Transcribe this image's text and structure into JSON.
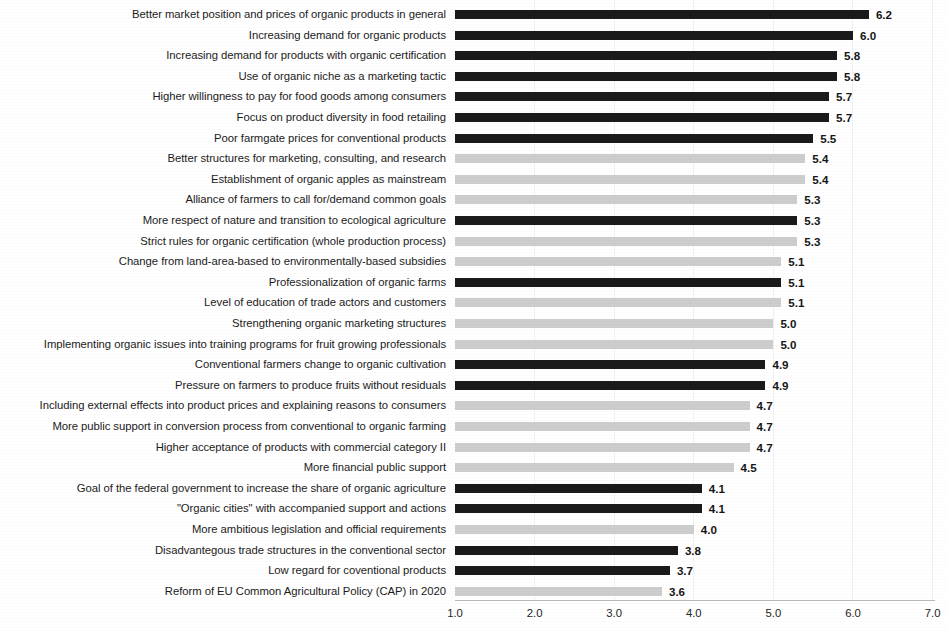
{
  "chart_data": {
    "type": "bar",
    "orientation": "horizontal",
    "title": "",
    "subtitle": "",
    "xlabel": "",
    "ylabel": "",
    "xlim": [
      1.0,
      7.0
    ],
    "xticks": [
      "1.0",
      "2.0",
      "3.0",
      "4.0",
      "5.0",
      "6.0",
      "7.0"
    ],
    "xtick_values": [
      1.0,
      2.0,
      3.0,
      4.0,
      5.0,
      6.0,
      7.0
    ],
    "grid": false,
    "legend": "none",
    "colors": {
      "dark_bar": "#1a1a1a",
      "light_bar": "#cdcdcd",
      "text": "#1b1b1b",
      "axis": "#b9b9b9"
    },
    "categories": [
      "Better market position and prices of organic products in general",
      "Increasing demand for organic products",
      "Increasing demand for products with organic certification",
      "Use of organic niche as a marketing tactic",
      "Higher willingness to pay for food goods among consumers",
      "Focus on product diversity in food retailing",
      "Poor farmgate prices for conventional products",
      "Better structures for marketing, consulting, and research",
      "Establishment of organic apples as mainstream",
      "Alliance of farmers to call for/demand common goals",
      "More respect of nature and transition to ecological agriculture",
      "Strict rules for organic certification (whole production process)",
      "Change from land-area-based to environmentally-based subsidies",
      "Professionalization of organic farms",
      "Level of education of trade actors and customers",
      "Strengthening organic marketing structures",
      "Implementing organic issues into training programs for fruit growing professionals",
      "Conventional farmers change to organic cultivation",
      "Pressure on farmers to produce fruits without residuals",
      "Including external effects into product prices and explaining reasons to consumers",
      "More public support in conversion process from conventional to organic farming",
      "Higher acceptance of products with commercial category II",
      "More financial public support",
      "Goal of the federal government to increase the share of organic agriculture",
      "\"Organic cities\" with accompanied support and actions",
      "More ambitious legislation and official requirements",
      "Disadvantegous trade structures in the conventional sector",
      "Low regard for coventional products",
      "Reform of EU Common Agricultural Policy (CAP) in 2020"
    ],
    "values": [
      6.2,
      6.0,
      5.8,
      5.8,
      5.7,
      5.7,
      5.5,
      5.4,
      5.4,
      5.3,
      5.3,
      5.3,
      5.1,
      5.1,
      5.1,
      5.0,
      5.0,
      4.9,
      4.9,
      4.7,
      4.7,
      4.7,
      4.5,
      4.1,
      4.1,
      4.0,
      3.8,
      3.7,
      3.6
    ],
    "value_labels": [
      "6.2",
      "6.0",
      "5.8",
      "5.8",
      "5.7",
      "5.7",
      "5.5",
      "5.4",
      "5.4",
      "5.3",
      "5.3",
      "5.3",
      "5.1",
      "5.1",
      "5.1",
      "5.0",
      "5.0",
      "4.9",
      "4.9",
      "4.7",
      "4.7",
      "4.7",
      "4.5",
      "4.1",
      "4.1",
      "4.0",
      "3.8",
      "3.7",
      "3.6"
    ],
    "bar_styles": [
      "dark",
      "dark",
      "dark",
      "dark",
      "dark",
      "dark",
      "dark",
      "light",
      "light",
      "light",
      "dark",
      "light",
      "light",
      "dark",
      "light",
      "light",
      "light",
      "dark",
      "dark",
      "light",
      "light",
      "light",
      "light",
      "dark",
      "dark",
      "light",
      "dark",
      "dark",
      "light"
    ]
  }
}
